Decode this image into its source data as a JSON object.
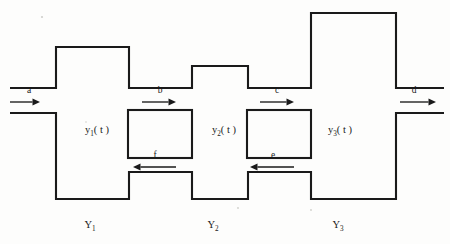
{
  "diagram": {
    "background_color": "#fdfdfc",
    "line_color": "#1a1a1a",
    "canvas": {
      "width": 450,
      "height": 244
    }
  },
  "tanks": [
    {
      "id": "tank-1",
      "state_label": "y",
      "state_sub": "1",
      "state_suffix": "( t )",
      "state_full": "y1( t )",
      "name_label": "Y",
      "name_sub": "1",
      "name_full": "Y1",
      "state_x": 97,
      "state_y": 133,
      "name_x": 90,
      "name_y": 228
    },
    {
      "id": "tank-2",
      "state_label": "y",
      "state_sub": "2",
      "state_suffix": "( t )",
      "state_full": "y2( t )",
      "name_label": "Y",
      "name_sub": "2",
      "name_full": "Y2",
      "state_x": 224,
      "state_y": 133,
      "name_x": 213,
      "name_y": 228
    },
    {
      "id": "tank-3",
      "state_label": "y",
      "state_sub": "3",
      "state_suffix": "( t )",
      "state_full": "y3( t )",
      "name_label": "Y",
      "name_sub": "3",
      "name_full": "Y3",
      "state_x": 340,
      "state_y": 133,
      "name_x": 338,
      "name_y": 228
    }
  ],
  "flows": [
    {
      "id": "flow-a",
      "label": "a",
      "direction": "right",
      "label_x": 29,
      "label_y": 93,
      "line_x1": 10,
      "line_x2": 40,
      "line_y": 102,
      "description": "inflow into tank 1"
    },
    {
      "id": "flow-b",
      "label": "b",
      "direction": "right",
      "label_x": 160,
      "label_y": 93,
      "line_x1": 142,
      "line_x2": 176,
      "line_y": 102,
      "description": "flow from tank 1 to tank 2"
    },
    {
      "id": "flow-c",
      "label": "c",
      "direction": "right",
      "label_x": 277,
      "label_y": 93,
      "line_x1": 260,
      "line_x2": 294,
      "line_y": 102,
      "description": "flow from tank 2 to tank 3"
    },
    {
      "id": "flow-d",
      "label": "d",
      "direction": "right",
      "label_x": 414,
      "label_y": 93,
      "line_x1": 400,
      "line_x2": 436,
      "line_y": 102,
      "description": "outflow from tank 3"
    },
    {
      "id": "flow-f",
      "label": "f",
      "direction": "left",
      "label_x": 155,
      "label_y": 158,
      "line_x1": 133,
      "line_x2": 176,
      "line_y": 167,
      "description": "recycle flow from tank 2 back to tank 1"
    },
    {
      "id": "flow-e",
      "label": "e",
      "direction": "left",
      "label_x": 273,
      "label_y": 158,
      "line_x1": 250,
      "line_x2": 294,
      "line_y": 167,
      "description": "recycle flow from tank 3 back to tank 2"
    }
  ],
  "geometry": {
    "vessel_path": "M 10,88 L 56,88 L 56,47 L 129,47 L 129,88 L 192,88 L 192,66 L 248,66 L 248,88 L 311,88 L 311,13 L 396,13 L 396,88 L 444,88 M 10,113 L 56,113 L 56,199 L 129,199 L 129,172 L 192,172 L 192,199 L 248,199 L 248,172 L 311,172 L 311,199 L 396,199 L 396,113 L 444,113",
    "islands": [
      {
        "id": "island-1",
        "x": 128,
        "y": 110,
        "width": 64,
        "height": 48
      },
      {
        "id": "island-2",
        "x": 247,
        "y": 110,
        "width": 64,
        "height": 48
      }
    ],
    "specks": [
      {
        "x": 42,
        "y": 17,
        "r": 1.1
      },
      {
        "x": 238,
        "y": 208,
        "r": 0.9
      },
      {
        "x": 311,
        "y": 210,
        "r": 0.9
      },
      {
        "x": 86,
        "y": 122,
        "r": 0.8
      }
    ]
  }
}
